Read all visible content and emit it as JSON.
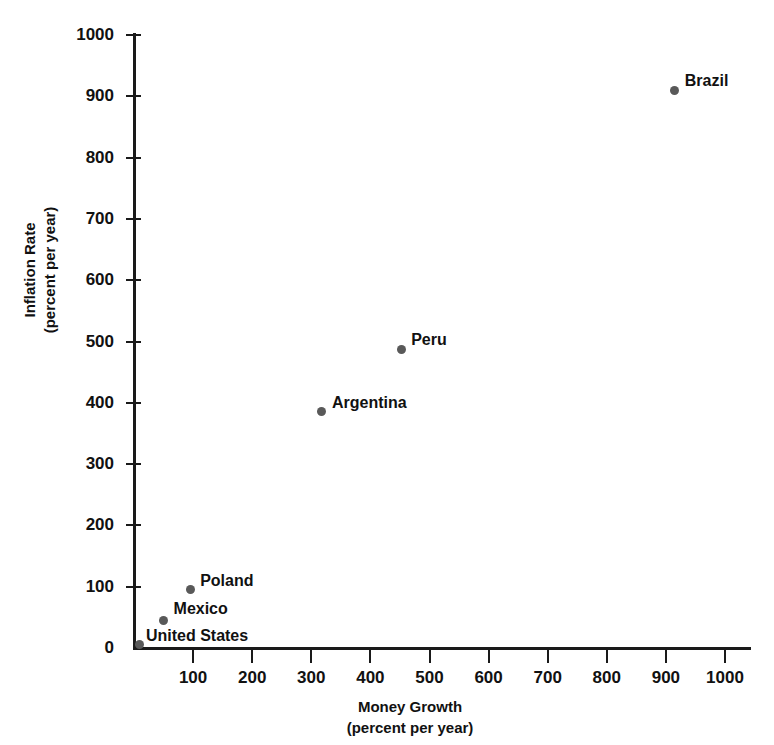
{
  "chart_data": {
    "type": "scatter",
    "title": "",
    "xlabel": "Money Growth",
    "xlabel_sub": "(percent per year)",
    "ylabel": "Inflation Rate",
    "ylabel_sub": "(percent per year)",
    "xlim": [
      0,
      1050
    ],
    "ylim": [
      0,
      1000
    ],
    "xticks": [
      100,
      200,
      300,
      400,
      500,
      600,
      700,
      800,
      900,
      1000
    ],
    "yticks": [
      0,
      100,
      200,
      300,
      400,
      500,
      600,
      700,
      800,
      900,
      1000
    ],
    "xtick_labels": [
      "100",
      "200",
      "300",
      "400",
      "500",
      "600",
      "700",
      "800",
      "900",
      "1000"
    ],
    "ytick_labels": [
      "0",
      "100",
      "200",
      "300",
      "400",
      "500",
      "600",
      "700",
      "800",
      "900",
      "1000"
    ],
    "grid": false,
    "legend": "none",
    "marker_color": "#595959",
    "axis_color": "#1a1a1a",
    "points": [
      {
        "label": "United States",
        "x": 10,
        "y": 5,
        "label_dx": 6,
        "label_dy": -18
      },
      {
        "label": "Mexico",
        "x": 50,
        "y": 45,
        "label_dx": 10,
        "label_dy": -20
      },
      {
        "label": "Poland",
        "x": 95,
        "y": 95,
        "label_dx": 10,
        "label_dy": -18
      },
      {
        "label": "Argentina",
        "x": 318,
        "y": 385,
        "label_dx": 10,
        "label_dy": -18
      },
      {
        "label": "Peru",
        "x": 452,
        "y": 487,
        "label_dx": 10,
        "label_dy": -18
      },
      {
        "label": "Brazil",
        "x": 915,
        "y": 910,
        "label_dx": 10,
        "label_dy": -18
      }
    ]
  }
}
